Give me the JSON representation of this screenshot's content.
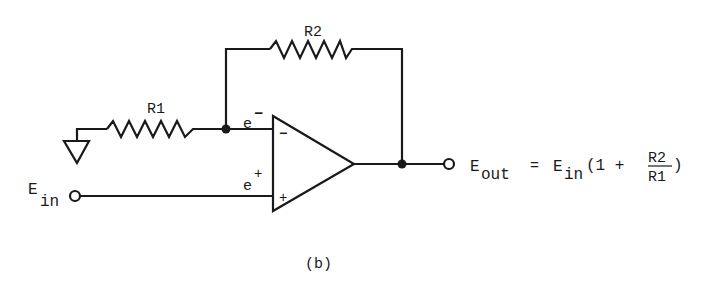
{
  "diagram": {
    "type": "non-inverting op-amp circuit",
    "resistor_feedback": "R2",
    "resistor_ground": "R1",
    "inverting_input_label": "e",
    "inverting_input_sup": "−",
    "noninverting_input_label": "e",
    "noninverting_input_sup": "+",
    "opamp_minus_sign": "−",
    "opamp_plus_sign": "+",
    "input": {
      "label": "E",
      "sub": "in"
    },
    "output": {
      "label": "E",
      "sub": "out",
      "equals": "=",
      "rhs_label": "E",
      "rhs_sub": "in",
      "paren_open": "(1 +",
      "frac_num": "R2",
      "frac_den": "R1",
      "paren_close": ")"
    },
    "caption": "(b)"
  },
  "colors": {
    "line": "#1a1a1a",
    "background": "#ffffff"
  }
}
